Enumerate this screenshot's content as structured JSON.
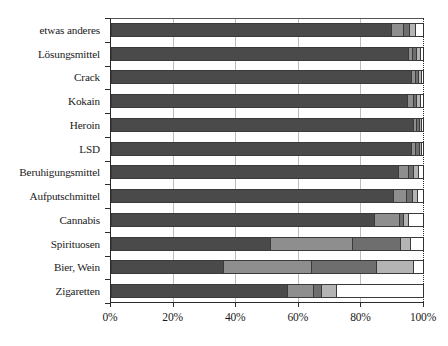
{
  "chart_data": {
    "type": "bar",
    "orientation": "horizontal",
    "stacked": true,
    "normalized_percent": true,
    "title": "",
    "subtitle": "",
    "xlabel": "",
    "ylabel": "",
    "xlim": [
      0,
      100
    ],
    "xticks": [
      0,
      20,
      40,
      60,
      80,
      100
    ],
    "xticklabels": [
      "0%",
      "20%",
      "40%",
      "60%",
      "80%",
      "100%"
    ],
    "grid": "vertical",
    "legend": "none",
    "legend_entries": [],
    "annotations": [],
    "categories": [
      "etwas anderes",
      "Lösungsmittel",
      "Crack",
      "Kokain",
      "Heroin",
      "LSD",
      "Beruhigungsmittel",
      "Aufputschmittel",
      "Cannabis",
      "Spirituosen",
      "Bier, Wein",
      "Zigaretten"
    ],
    "series": [
      {
        "name": "series-1",
        "color": "#4a4a4a",
        "values": [
          91.0,
          96.5,
          97.5,
          96.0,
          98.0,
          97.5,
          93.0,
          91.5,
          85.5,
          51.5,
          36.0,
          57.0
        ]
      },
      {
        "name": "series-2",
        "color": "#8e8e8e",
        "values": [
          3.5,
          1.0,
          1.0,
          1.6,
          0.8,
          1.0,
          3.0,
          4.0,
          7.5,
          26.5,
          28.5,
          8.0
        ]
      },
      {
        "name": "series-3",
        "color": "#6e6e6e",
        "values": [
          1.6,
          0.9,
          0.6,
          0.9,
          0.6,
          0.7,
          1.4,
          1.6,
          1.2,
          15.0,
          21.0,
          2.5
        ]
      },
      {
        "name": "series-4",
        "color": "#b4b4b4",
        "values": [
          1.6,
          0.9,
          0.5,
          0.8,
          0.4,
          0.5,
          1.3,
          1.4,
          1.3,
          3.2,
          11.5,
          4.5
        ]
      },
      {
        "name": "series-5",
        "color": "#ffffff",
        "values": [
          2.3,
          0.7,
          0.4,
          0.7,
          0.2,
          0.3,
          1.3,
          1.5,
          4.5,
          3.8,
          3.0,
          28.0
        ]
      }
    ]
  }
}
